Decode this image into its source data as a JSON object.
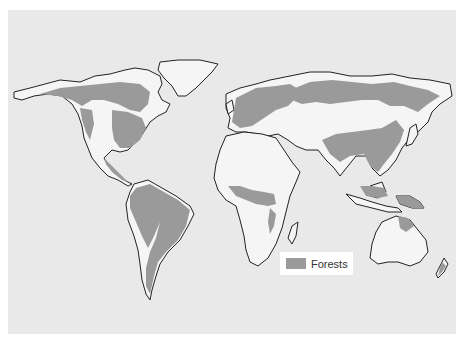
{
  "map": {
    "title": "World forest distribution",
    "colors": {
      "background": "#e9e9e9",
      "land": "#f5f5f5",
      "forest": "#9a9a9a",
      "coastline": "#222222"
    }
  },
  "legend": {
    "items": [
      {
        "label": "Forests",
        "color": "#9a9a9a"
      }
    ]
  }
}
